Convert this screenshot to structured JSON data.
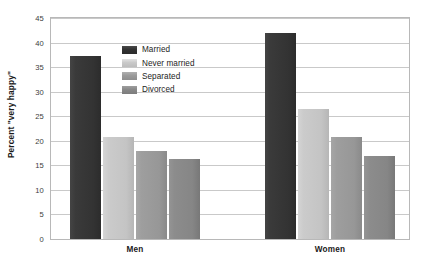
{
  "chart_data": {
    "type": "bar",
    "title": "",
    "xlabel": "",
    "ylabel": "Percent \"very happy\"",
    "categories": [
      "Men",
      "Women"
    ],
    "series": [
      {
        "name": "Married",
        "values": [
          37.3,
          42.0
        ],
        "color": "#333333"
      },
      {
        "name": "Never married",
        "values": [
          20.8,
          26.5
        ],
        "color": "#c9c9c9"
      },
      {
        "name": "Separated",
        "values": [
          18.0,
          20.8
        ],
        "color": "#9a9a9a"
      },
      {
        "name": "Divorced",
        "values": [
          16.2,
          17.0
        ],
        "color": "#888888"
      }
    ],
    "ylim": [
      0,
      45
    ],
    "yticks": [
      0,
      5,
      10,
      15,
      20,
      25,
      30,
      35,
      40,
      45
    ],
    "ytick_labels": [
      "0",
      "5",
      "10",
      "15",
      "20",
      "25",
      "30",
      "35",
      "40",
      "45"
    ],
    "grid": true,
    "grid_axis": "y",
    "legend_position": "upper-center-left",
    "legend_entries": [
      "Married",
      "Never married",
      "Separated",
      "Divorced"
    ],
    "background": "#ffffff",
    "frame_color": "#b8b8b8",
    "gridline_color": "#c9c9c9"
  },
  "axis": {
    "y_title": "Percent \"very happy\"",
    "ticks": [
      {
        "label": "45",
        "value": 45
      },
      {
        "label": "40",
        "value": 40
      },
      {
        "label": "35",
        "value": 35
      },
      {
        "label": "30",
        "value": 30
      },
      {
        "label": "25",
        "value": 25
      },
      {
        "label": "20",
        "value": 20
      },
      {
        "label": "15",
        "value": 15
      },
      {
        "label": "10",
        "value": 10
      },
      {
        "label": "5",
        "value": 5
      },
      {
        "label": "0",
        "value": 0
      }
    ]
  },
  "groups": [
    {
      "label": "Men",
      "bars": [
        {
          "series": "Married",
          "value": 37.3
        },
        {
          "series": "Never married",
          "value": 20.8
        },
        {
          "series": "Separated",
          "value": 18.0
        },
        {
          "series": "Divorced",
          "value": 16.2
        }
      ]
    },
    {
      "label": "Women",
      "bars": [
        {
          "series": "Married",
          "value": 42.0
        },
        {
          "series": "Never married",
          "value": 26.5
        },
        {
          "series": "Separated",
          "value": 20.8
        },
        {
          "series": "Divorced",
          "value": 17.0
        }
      ]
    }
  ],
  "legend": {
    "items": [
      {
        "label": "Married"
      },
      {
        "label": "Never married"
      },
      {
        "label": "Separated"
      },
      {
        "label": "Divorced"
      }
    ]
  }
}
